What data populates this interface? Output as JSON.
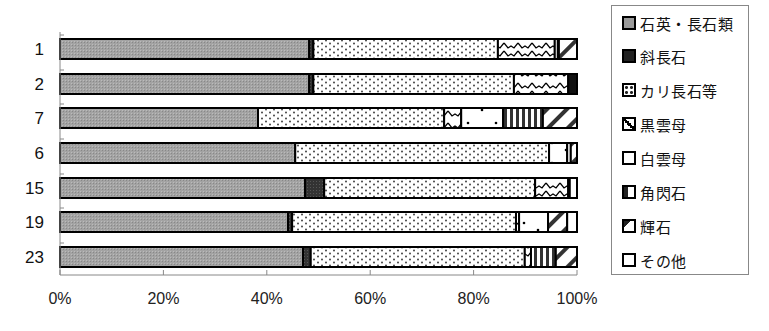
{
  "chart_data": {
    "type": "bar",
    "orientation": "horizontal",
    "stacked": "percent",
    "title": "",
    "xlabel": "",
    "ylabel": "",
    "xlim": [
      0,
      100
    ],
    "x_ticks": [
      "0%",
      "20%",
      "40%",
      "60%",
      "80%",
      "100%"
    ],
    "categories": [
      "1",
      "2",
      "7",
      "6",
      "15",
      "19",
      "23"
    ],
    "series": [
      {
        "name": "石英・長石類",
        "pattern": "gray-fine",
        "values": [
          48.2,
          48.2,
          38.3,
          45.5,
          47.4,
          44.1,
          47.0
        ]
      },
      {
        "name": "斜長石",
        "pattern": "dark-solid",
        "values": [
          0.8,
          0.8,
          0.0,
          0.0,
          3.7,
          0.8,
          1.5
        ]
      },
      {
        "name": "カリ長石等",
        "pattern": "dots-dense",
        "values": [
          35.7,
          38.8,
          36.0,
          49.1,
          40.8,
          43.3,
          41.4
        ]
      },
      {
        "name": "黒雲母",
        "pattern": "zigzag",
        "values": [
          11.0,
          10.5,
          3.3,
          0.0,
          6.4,
          0.6,
          1.2
        ]
      },
      {
        "name": "白雲母",
        "pattern": "sparse-dots",
        "values": [
          0.6,
          0.0,
          8.1,
          3.5,
          0.3,
          5.6,
          0.0
        ]
      },
      {
        "name": "角閃石",
        "pattern": "vertical-stripes",
        "values": [
          0.2,
          0.0,
          7.7,
          0.7,
          0.0,
          0.0,
          4.8
        ]
      },
      {
        "name": "輝石",
        "pattern": "diagonal-stripes",
        "values": [
          3.5,
          0.0,
          6.6,
          1.2,
          0.0,
          3.7,
          4.1
        ]
      },
      {
        "name": "その他",
        "pattern": "white-or-black",
        "values": [
          0.0,
          1.7,
          0.0,
          0.0,
          1.4,
          1.9,
          0.0
        ]
      }
    ],
    "grid": false,
    "legend_position": "right"
  },
  "legend": {
    "items": [
      {
        "label": "石英・長石類"
      },
      {
        "label": "斜長石"
      },
      {
        "label": "カリ長石等"
      },
      {
        "label": "黒雲母"
      },
      {
        "label": "白雲母"
      },
      {
        "label": "角閃石"
      },
      {
        "label": "輝石"
      },
      {
        "label": "その他"
      }
    ]
  },
  "colors": {
    "quartz": "#9a9a9a",
    "plagioclase": "#333333",
    "outline": "#000000",
    "axis": "#888888"
  }
}
